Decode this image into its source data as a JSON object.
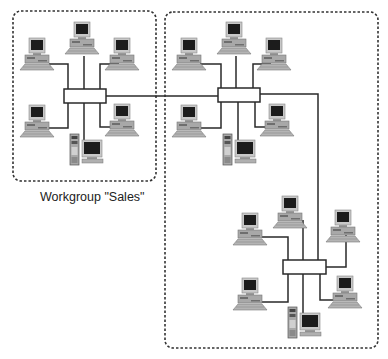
{
  "colors": {
    "line": "#2a2a2a",
    "border": "#333333",
    "monitor_body": "#c8c8c8",
    "screen": "#1c1c1c",
    "case": "#a8a8a8",
    "case_dark": "#6e6e6e",
    "hub_fill": "#ffffff"
  },
  "workgroups": [
    {
      "id": "sales",
      "label": "Workgroup \"Sales\"",
      "box": {
        "x": 13,
        "y": 11,
        "w": 143,
        "h": 170
      }
    },
    {
      "id": "other",
      "label": "",
      "box": {
        "x": 165,
        "y": 12,
        "w": 213,
        "h": 336
      }
    }
  ],
  "label_pos": {
    "x": 40,
    "y": 190
  },
  "hubs": [
    {
      "id": "hub-sales",
      "x": 64,
      "y": 89,
      "w": 42,
      "h": 14
    },
    {
      "id": "hub-upper",
      "x": 218,
      "y": 88,
      "w": 42,
      "h": 14
    },
    {
      "id": "hub-lower",
      "x": 283,
      "y": 260,
      "w": 43,
      "h": 14
    }
  ],
  "workstations": [
    {
      "id": "ws-s1",
      "x": 22,
      "y": 38
    },
    {
      "id": "ws-s2",
      "x": 67,
      "y": 22
    },
    {
      "id": "ws-s3",
      "x": 107,
      "y": 38
    },
    {
      "id": "ws-s4",
      "x": 22,
      "y": 105
    },
    {
      "id": "ws-s5",
      "x": 107,
      "y": 104
    },
    {
      "id": "ws-u1",
      "x": 174,
      "y": 38
    },
    {
      "id": "ws-u2",
      "x": 219,
      "y": 22
    },
    {
      "id": "ws-u3",
      "x": 259,
      "y": 38
    },
    {
      "id": "ws-u4",
      "x": 174,
      "y": 105
    },
    {
      "id": "ws-u5",
      "x": 262,
      "y": 104
    },
    {
      "id": "ws-l1",
      "x": 235,
      "y": 213
    },
    {
      "id": "ws-l2",
      "x": 275,
      "y": 196
    },
    {
      "id": "ws-l3",
      "x": 328,
      "y": 210
    },
    {
      "id": "ws-l4",
      "x": 235,
      "y": 278
    },
    {
      "id": "ws-l5",
      "x": 330,
      "y": 276
    }
  ],
  "servers": [
    {
      "id": "server-sales",
      "x": 70,
      "y": 134
    },
    {
      "id": "server-upper",
      "x": 223,
      "y": 134
    },
    {
      "id": "server-lower",
      "x": 288,
      "y": 307
    }
  ],
  "links": [
    {
      "points": [
        [
          49,
          64
        ],
        [
          68,
          64
        ],
        [
          68,
          89
        ]
      ]
    },
    {
      "points": [
        [
          84,
          56
        ],
        [
          84,
          89
        ]
      ]
    },
    {
      "points": [
        [
          119,
          64
        ],
        [
          100,
          64
        ],
        [
          100,
          89
        ]
      ]
    },
    {
      "points": [
        [
          49,
          128
        ],
        [
          68,
          128
        ],
        [
          68,
          103
        ]
      ]
    },
    {
      "points": [
        [
          120,
          127
        ],
        [
          100,
          127
        ],
        [
          100,
          103
        ]
      ]
    },
    {
      "points": [
        [
          84,
          103
        ],
        [
          84,
          142
        ]
      ]
    },
    {
      "points": [
        [
          106,
          96
        ],
        [
          218,
          96
        ]
      ]
    },
    {
      "points": [
        [
          200,
          64
        ],
        [
          221,
          64
        ],
        [
          221,
          88
        ]
      ]
    },
    {
      "points": [
        [
          236,
          56
        ],
        [
          236,
          88
        ]
      ]
    },
    {
      "points": [
        [
          271,
          64
        ],
        [
          253,
          64
        ],
        [
          253,
          88
        ]
      ]
    },
    {
      "points": [
        [
          200,
          128
        ],
        [
          221,
          128
        ],
        [
          221,
          102
        ]
      ]
    },
    {
      "points": [
        [
          274,
          127
        ],
        [
          255,
          127
        ],
        [
          255,
          102
        ]
      ]
    },
    {
      "points": [
        [
          238,
          102
        ],
        [
          238,
          142
        ]
      ]
    },
    {
      "points": [
        [
          260,
          94
        ],
        [
          318,
          94
        ],
        [
          318,
          260
        ]
      ]
    },
    {
      "points": [
        [
          261,
          237
        ],
        [
          288,
          237
        ],
        [
          288,
          260
        ]
      ]
    },
    {
      "points": [
        [
          303,
          220
        ],
        [
          303,
          260
        ]
      ]
    },
    {
      "points": [
        [
          346,
          233
        ],
        [
          346,
          267
        ],
        [
          326,
          267
        ]
      ]
    },
    {
      "points": [
        [
          261,
          302
        ],
        [
          288,
          302
        ],
        [
          288,
          274
        ]
      ]
    },
    {
      "points": [
        [
          303,
          274
        ],
        [
          303,
          315
        ]
      ]
    },
    {
      "points": [
        [
          340,
          300
        ],
        [
          320,
          300
        ],
        [
          320,
          274
        ]
      ]
    }
  ]
}
